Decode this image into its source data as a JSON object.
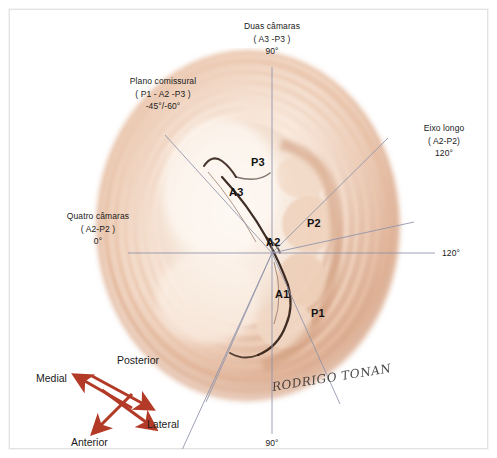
{
  "figure": {
    "signature": "RODRIGO TONAN"
  },
  "planes": {
    "two_chamber": {
      "name": "Duas câmaras",
      "segments": "( A3 -P3 )",
      "angle": "90°"
    },
    "commissural": {
      "name": "Plano comissural",
      "segments": "( P1 - A2 -P3 )",
      "angle": "-45°/-60°"
    },
    "long_axis": {
      "name": "Eixo longo",
      "segments": "( A2-P2)",
      "angle": "120°"
    },
    "four_chamber": {
      "name": "Quatro câmaras",
      "segments": "( A2-P2 )",
      "angle": "0°"
    },
    "right_angle": "120°",
    "bottom_angle": "90°"
  },
  "valve_segments": [
    {
      "id": "P3",
      "label": "P3"
    },
    {
      "id": "A3",
      "label": "A3"
    },
    {
      "id": "P2",
      "label": "P2"
    },
    {
      "id": "A2",
      "label": "A2"
    },
    {
      "id": "A1",
      "label": "A1"
    },
    {
      "id": "P1",
      "label": "P1"
    }
  ],
  "orientation": {
    "medial": "Medial",
    "posterior": "Posterior",
    "anterior": "Anterior",
    "lateral": "Lateral"
  },
  "colors": {
    "arrow": "#b33a27",
    "line": "#8a8fa8",
    "text": "#1a1a1a",
    "tissue_light": "#fbf0e6",
    "tissue_mid": "#e3b79c",
    "tissue_dark": "#b97a5c",
    "frame": "#e3e3e3"
  }
}
